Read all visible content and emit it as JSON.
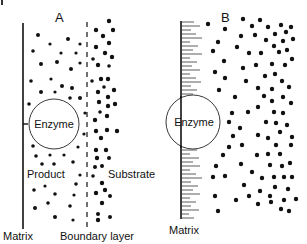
{
  "diagram": {
    "panels": [
      {
        "id": "A",
        "title": "A",
        "enzyme_label": "Enzyme",
        "product_label": "Product",
        "substrate_label": "Substrate",
        "matrix_label": "Matrix",
        "boundary_label": "Boundary layer"
      },
      {
        "id": "B",
        "title": "B",
        "enzyme_label": "Enzyme",
        "matrix_label": "Matrix"
      }
    ],
    "colors": {
      "ink": "#111111",
      "background": "#ffffff"
    }
  }
}
